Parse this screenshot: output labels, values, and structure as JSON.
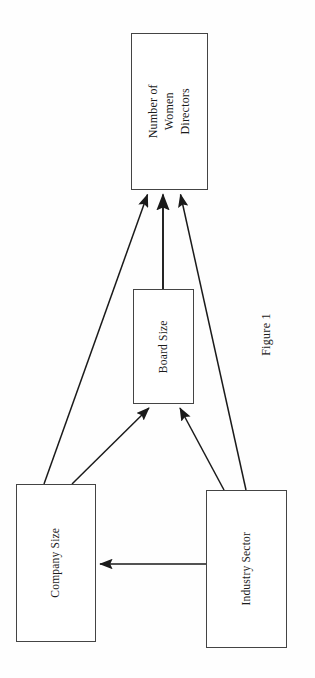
{
  "figure": {
    "caption": "Figure 1",
    "background_color": "#fefefe",
    "line_color": "#1a1a1a",
    "box_border_color": "#444444"
  },
  "nodes": [
    {
      "id": "women-directors",
      "label": "Number of Women\nDirectors",
      "role": "outcome"
    },
    {
      "id": "board-size",
      "label": "Board Size",
      "role": "mediator"
    },
    {
      "id": "company-size",
      "label": "Company Size",
      "role": "predictor"
    },
    {
      "id": "industry-sector",
      "label": "Industry Sector",
      "role": "predictor"
    }
  ],
  "edges": [
    {
      "id": "company-size-to-women-directors",
      "from": "company-size",
      "to": "women-directors"
    },
    {
      "id": "board-size-to-women-directors",
      "from": "board-size",
      "to": "women-directors"
    },
    {
      "id": "industry-sector-to-women-directors",
      "from": "industry-sector",
      "to": "women-directors"
    },
    {
      "id": "company-size-to-board-size",
      "from": "company-size",
      "to": "board-size"
    },
    {
      "id": "industry-sector-to-board-size",
      "from": "industry-sector",
      "to": "board-size"
    },
    {
      "id": "industry-sector-to-company-size",
      "from": "industry-sector",
      "to": "company-size"
    }
  ]
}
